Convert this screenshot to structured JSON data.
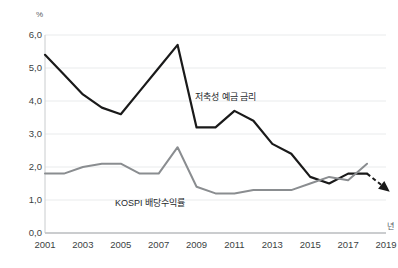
{
  "chart_data": {
    "type": "line",
    "title": "",
    "xlabel": "년",
    "ylabel": "%",
    "xlim": [
      2001,
      2019
    ],
    "ylim": [
      0.0,
      6.0
    ],
    "grid": true,
    "legend_position": "inline-annotation",
    "y_ticks": [
      "6,0",
      "5,0",
      "4,0",
      "3,0",
      "2,0",
      "1,0",
      "0,0"
    ],
    "y_tick_values": [
      6.0,
      5.0,
      4.0,
      3.0,
      2.0,
      1.0,
      0.0
    ],
    "x_ticks": [
      "2001",
      "2003",
      "2005",
      "2007",
      "2009",
      "2011",
      "2013",
      "2015",
      "2017",
      "2019"
    ],
    "x_tick_values": [
      2001,
      2003,
      2005,
      2007,
      2009,
      2011,
      2013,
      2015,
      2017,
      2019
    ],
    "x": [
      2001,
      2002,
      2003,
      2004,
      2005,
      2006,
      2007,
      2008,
      2009,
      2010,
      2011,
      2012,
      2013,
      2014,
      2015,
      2016,
      2017,
      2018
    ],
    "series": [
      {
        "name": "저축성 예금 금리",
        "color": "#1a1a1a",
        "width": 2.2,
        "values": [
          5.4,
          4.8,
          4.2,
          3.8,
          3.6,
          4.3,
          5.0,
          5.7,
          3.2,
          3.2,
          3.7,
          3.4,
          2.7,
          2.4,
          1.7,
          1.5,
          1.8,
          1.8
        ]
      },
      {
        "name": "KOSPI 배당수익률",
        "color": "#8a8d90",
        "width": 2.0,
        "values": [
          1.8,
          1.8,
          2.0,
          2.1,
          2.1,
          1.8,
          1.8,
          2.6,
          1.4,
          1.2,
          1.2,
          1.3,
          1.3,
          1.3,
          1.5,
          1.7,
          1.6,
          2.1
        ]
      }
    ],
    "annotations": [
      {
        "name": "deposit-rate-label",
        "text": "저축성 예금 금리",
        "x": 2010.0,
        "y": 4.45
      },
      {
        "name": "kospi-yield-label",
        "text": "KOSPI 배당수익률",
        "x": 2006.2,
        "y": 1.05
      },
      {
        "name": "forecast-arrow",
        "text": "",
        "style": "dashed-down-right",
        "from": [
          2018,
          1.8
        ],
        "to": [
          2019.2,
          1.25
        ]
      }
    ]
  },
  "axes": {
    "y_unit": "%",
    "x_unit": "년"
  }
}
